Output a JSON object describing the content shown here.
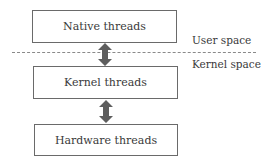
{
  "diagram": {
    "boxes": [
      {
        "id": "native",
        "label": "Native threads"
      },
      {
        "id": "kernel",
        "label": "Kernel threads"
      },
      {
        "id": "hardware",
        "label": "Hardware threads"
      }
    ],
    "regions": {
      "user_space": "User space",
      "kernel_space": "Kernel space"
    },
    "arrows": [
      {
        "from": "native",
        "to": "kernel",
        "type": "bidirectional"
      },
      {
        "from": "kernel",
        "to": "hardware",
        "type": "bidirectional"
      }
    ],
    "colors": {
      "box_border": "#6a6a6a",
      "arrow": "#5e5e5e",
      "divider": "#8a8a8a"
    }
  }
}
